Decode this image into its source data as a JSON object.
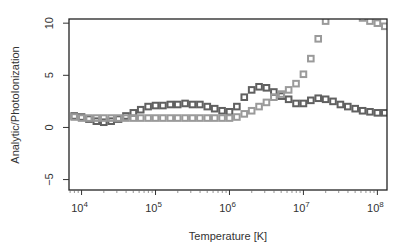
{
  "chart_data": {
    "type": "scatter",
    "title": "",
    "xlabel": "Temperature [K]",
    "ylabel": "Analytic/PhotoIonization",
    "xscale": "log",
    "xlim_log10": [
      3.83,
      8.13
    ],
    "ylim": [
      -6.0,
      10.4
    ],
    "x_ticks": [
      {
        "log10": 4,
        "label_base": "10",
        "label_exp": "4"
      },
      {
        "log10": 5,
        "label_base": "10",
        "label_exp": "5"
      },
      {
        "log10": 6,
        "label_base": "10",
        "label_exp": "6"
      },
      {
        "log10": 7,
        "label_base": "10",
        "label_exp": "7"
      },
      {
        "log10": 8,
        "label_base": "10",
        "label_exp": "8"
      }
    ],
    "y_ticks": [
      -5,
      0,
      5,
      10
    ],
    "y_tick_labels": [
      "−5",
      "0",
      "5",
      "10"
    ],
    "grid": false,
    "legend": null,
    "x_log10": [
      3.9,
      4.0,
      4.1,
      4.2,
      4.3,
      4.4,
      4.5,
      4.6,
      4.7,
      4.8,
      4.9,
      5.0,
      5.1,
      5.2,
      5.3,
      5.4,
      5.5,
      5.6,
      5.7,
      5.8,
      5.9,
      6.0,
      6.1,
      6.2,
      6.3,
      6.4,
      6.5,
      6.6,
      6.7,
      6.8,
      6.9,
      7.0,
      7.1,
      7.2,
      7.3,
      7.4,
      7.5,
      7.6,
      7.7,
      7.8,
      7.9,
      8.0,
      8.1
    ],
    "series": [
      {
        "name": "dark",
        "color": "#606060",
        "marker": "square-open",
        "values": [
          1.1,
          1.0,
          0.8,
          0.6,
          0.5,
          0.6,
          0.8,
          1.1,
          1.4,
          1.7,
          2.0,
          2.1,
          2.1,
          2.2,
          2.2,
          2.3,
          2.2,
          2.2,
          2.0,
          1.8,
          1.6,
          1.5,
          2.0,
          2.9,
          3.6,
          3.9,
          3.8,
          3.4,
          3.0,
          2.7,
          2.3,
          2.3,
          2.6,
          2.8,
          2.7,
          2.5,
          2.2,
          2.0,
          1.8,
          1.6,
          1.5,
          1.4,
          1.4
        ]
      },
      {
        "name": "light",
        "color": "#9a9a9a",
        "marker": "square-open",
        "values": [
          1.0,
          0.9,
          0.9,
          0.9,
          0.9,
          0.9,
          0.9,
          0.9,
          0.9,
          0.9,
          0.9,
          0.9,
          0.9,
          0.9,
          0.9,
          0.9,
          0.9,
          0.9,
          0.9,
          0.9,
          0.9,
          0.9,
          1.0,
          1.3,
          1.6,
          2.0,
          2.4,
          2.9,
          3.2,
          3.6,
          4.2,
          5.1,
          6.6,
          8.5,
          10.2,
          11.5,
          12.0,
          12.0,
          11.0,
          10.5,
          10.2,
          10.0,
          9.7
        ]
      }
    ]
  }
}
